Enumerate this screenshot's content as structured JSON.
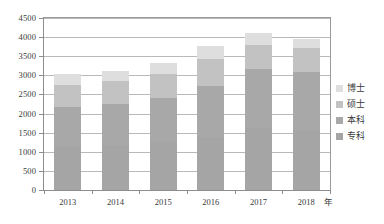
{
  "chart_data": {
    "type": "bar",
    "stacked": true,
    "title": "",
    "subtitle": "",
    "xlabel": "年",
    "ylabel": "",
    "categories": [
      "2013",
      "2014",
      "2015",
      "2016",
      "2017",
      "2018"
    ],
    "series": [
      {
        "name": "专科",
        "color": "#a5a5a5",
        "values": [
          1150,
          1190,
          1250,
          1400,
          1620,
          1580
        ]
      },
      {
        "name": "本科",
        "color": "#a8a8a8",
        "values": [
          1020,
          1070,
          1150,
          1320,
          1540,
          1500
        ]
      },
      {
        "name": "硕士",
        "color": "#c2c2c2",
        "values": [
          570,
          580,
          640,
          720,
          640,
          630
        ]
      },
      {
        "name": "博士",
        "color": "#dedede",
        "values": [
          300,
          280,
          290,
          320,
          310,
          250
        ]
      }
    ],
    "totals": [
      3040,
      3120,
      3330,
      3760,
      4110,
      3960
    ],
    "ylim": [
      0,
      4500
    ],
    "ytick_step": 500,
    "yticks": [
      "0",
      "500",
      "1000",
      "1500",
      "2000",
      "2500",
      "3000",
      "3500",
      "4000",
      "4500"
    ],
    "grid": true,
    "legend_position": "right"
  },
  "axes": {
    "x_unit_label": "年",
    "x_tick_labels": [
      "2013",
      "2014",
      "2015",
      "2016",
      "2017",
      "2018"
    ],
    "y_tick_labels": [
      "4500",
      "4000",
      "3500",
      "3000",
      "2500",
      "2000",
      "1500",
      "1000",
      "500",
      "0"
    ]
  },
  "legend": {
    "items": [
      {
        "label": "博士",
        "color": "#dedede"
      },
      {
        "label": "硕士",
        "color": "#c2c2c2"
      },
      {
        "label": "本科",
        "color": "#a8a8a8"
      },
      {
        "label": "专科",
        "color": "#a5a5a5"
      }
    ]
  }
}
